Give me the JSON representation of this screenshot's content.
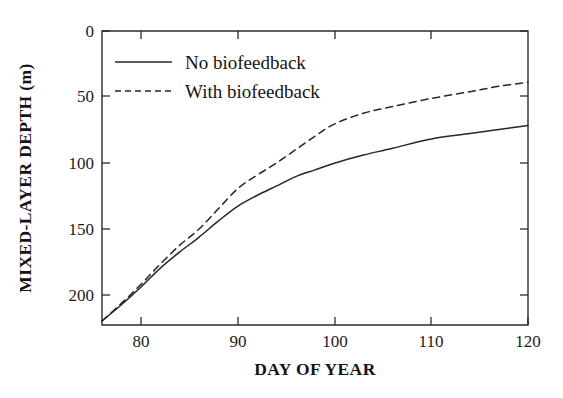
{
  "figure": {
    "background_color": "#ffffff",
    "ink_color": "#262626"
  },
  "chart_data": {
    "type": "line",
    "title": "",
    "xlabel": "DAY OF YEAR",
    "ylabel": "MIXED-LAYER DEPTH (m)",
    "xlim": [
      76,
      120
    ],
    "ylim": [
      0,
      218
    ],
    "y_inverted": true,
    "grid": false,
    "legend_position": "upper-left-inside",
    "x_ticks": [
      80,
      90,
      100,
      110,
      120
    ],
    "x_tick_labels": [
      "80",
      "90",
      "100",
      "110",
      "120"
    ],
    "y_ticks": [
      0,
      50,
      100,
      150,
      200
    ],
    "y_tick_labels": [
      "0",
      "50",
      "100",
      "150",
      "200"
    ],
    "x": [
      76,
      78,
      80,
      82,
      84,
      86,
      88,
      90,
      92,
      94,
      96,
      98,
      100,
      103,
      106,
      110,
      114,
      117,
      120
    ],
    "series": [
      {
        "name": "No biofeedback",
        "style": "solid",
        "color": "#262626",
        "values": [
          215,
          203,
          190,
          176,
          164,
          153,
          141,
          130,
          122,
          115,
          108,
          103,
          98,
          92,
          87,
          80,
          76,
          73,
          70
        ]
      },
      {
        "name": "With biofeedback",
        "style": "dashed",
        "color": "#262626",
        "values": [
          215,
          202,
          188,
          173,
          159,
          147,
          132,
          117,
          107,
          98,
          88,
          78,
          69,
          61,
          56,
          50,
          45,
          41,
          38
        ]
      }
    ]
  },
  "legend": {
    "entries": [
      {
        "label": "No biofeedback",
        "style": "solid"
      },
      {
        "label": "With biofeedback",
        "style": "dashed"
      }
    ]
  },
  "axes": {
    "x_title": "DAY OF YEAR",
    "y_title": "MIXED-LAYER DEPTH (m)"
  }
}
